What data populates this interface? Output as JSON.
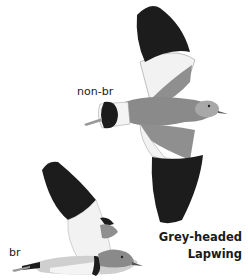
{
  "plate": {
    "species_name_line1": "Grey-headed",
    "species_name_line2": "Lapwing",
    "figures": [
      {
        "id": "non-breeding-flight",
        "label": "non-br"
      },
      {
        "id": "breeding-flight",
        "label": "br"
      }
    ]
  },
  "colors": {
    "background": "#ffffff",
    "wingtip_black": "#1c1c1c",
    "body_grey": "#8a8a8a",
    "head_grey": "#a8a8a8",
    "wing_white": "#f2f2f2",
    "bill": "#6b6b6b"
  }
}
